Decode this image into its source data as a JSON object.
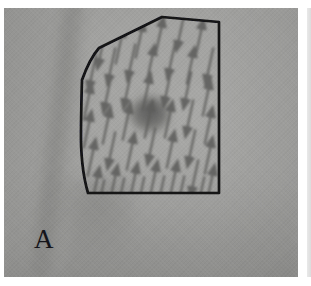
{
  "figure": {
    "panel_label": "A",
    "modality": "clinical photograph",
    "colors": {
      "skin_light": "#a8a8a6",
      "skin_mid": "#9a9a98",
      "skin_shadow": "#8b8b89",
      "outline_ink": "#121216",
      "arrow_ink": "#5d5d5b",
      "lesion": "#6f6f6d",
      "plate_background": "#ffffff",
      "panel_letter_color": "#15151a"
    },
    "plate": {
      "x": 4,
      "y": 8,
      "width": 294,
      "height": 269
    },
    "outline": {
      "name": "marked-region-polygon",
      "stroke_width": 2.6,
      "closed": true,
      "vertices": [
        [
          158,
          9
        ],
        [
          215,
          14
        ],
        [
          215,
          185
        ],
        [
          84,
          185
        ],
        [
          77,
          120
        ],
        [
          78,
          72
        ],
        [
          95,
          40
        ]
      ]
    },
    "lesion": {
      "name": "central-lesion",
      "cx": 146,
      "cy": 106,
      "rx": 19,
      "ry": 17
    },
    "arrows": {
      "count": 60,
      "tilt_degrees": 12,
      "directions": [
        "up",
        "down"
      ],
      "stroke_width": 2.2,
      "head_width": 11,
      "head_length": 13
    }
  },
  "chart_data": {
    "type": "scatter",
    "xlabel": "",
    "ylabel": "",
    "legend": [],
    "annotations": [
      "A"
    ],
    "series": [
      {
        "name": "arrow-field",
        "note": "each point is an arrow base with its pointing direction",
        "points": [
          {
            "x": 97,
            "y": 44,
            "dir": "down"
          },
          {
            "x": 116,
            "y": 36,
            "dir": "up"
          },
          {
            "x": 136,
            "y": 30,
            "dir": "up"
          },
          {
            "x": 156,
            "y": 26,
            "dir": "up"
          },
          {
            "x": 176,
            "y": 26,
            "dir": "down"
          },
          {
            "x": 196,
            "y": 28,
            "dir": "up"
          },
          {
            "x": 88,
            "y": 66,
            "dir": "down"
          },
          {
            "x": 107,
            "y": 60,
            "dir": "down"
          },
          {
            "x": 127,
            "y": 56,
            "dir": "down"
          },
          {
            "x": 147,
            "y": 54,
            "dir": "up"
          },
          {
            "x": 167,
            "y": 54,
            "dir": "down"
          },
          {
            "x": 187,
            "y": 56,
            "dir": "up"
          },
          {
            "x": 205,
            "y": 60,
            "dir": "down"
          },
          {
            "x": 84,
            "y": 92,
            "dir": "up"
          },
          {
            "x": 103,
            "y": 88,
            "dir": "down"
          },
          {
            "x": 123,
            "y": 84,
            "dir": "down"
          },
          {
            "x": 143,
            "y": 82,
            "dir": "up"
          },
          {
            "x": 163,
            "y": 82,
            "dir": "down"
          },
          {
            "x": 183,
            "y": 84,
            "dir": "down"
          },
          {
            "x": 203,
            "y": 88,
            "dir": "up"
          },
          {
            "x": 84,
            "y": 120,
            "dir": "up"
          },
          {
            "x": 103,
            "y": 116,
            "dir": "up"
          },
          {
            "x": 123,
            "y": 112,
            "dir": "up"
          },
          {
            "x": 145,
            "y": 110,
            "dir": "up"
          },
          {
            "x": 165,
            "y": 110,
            "dir": "up"
          },
          {
            "x": 185,
            "y": 112,
            "dir": "down"
          },
          {
            "x": 205,
            "y": 116,
            "dir": "up"
          },
          {
            "x": 88,
            "y": 148,
            "dir": "up"
          },
          {
            "x": 107,
            "y": 144,
            "dir": "down"
          },
          {
            "x": 127,
            "y": 142,
            "dir": "up"
          },
          {
            "x": 147,
            "y": 140,
            "dir": "down"
          },
          {
            "x": 167,
            "y": 140,
            "dir": "up"
          },
          {
            "x": 187,
            "y": 142,
            "dir": "down"
          },
          {
            "x": 205,
            "y": 146,
            "dir": "up"
          },
          {
            "x": 92,
            "y": 176,
            "dir": "up"
          },
          {
            "x": 110,
            "y": 174,
            "dir": "up"
          },
          {
            "x": 130,
            "y": 172,
            "dir": "up"
          },
          {
            "x": 150,
            "y": 170,
            "dir": "up"
          },
          {
            "x": 170,
            "y": 170,
            "dir": "up"
          },
          {
            "x": 190,
            "y": 172,
            "dir": "down"
          },
          {
            "x": 207,
            "y": 174,
            "dir": "up"
          },
          {
            "x": 96,
            "y": 192,
            "dir": "down"
          },
          {
            "x": 116,
            "y": 190,
            "dir": "down"
          },
          {
            "x": 136,
            "y": 189,
            "dir": "down"
          },
          {
            "x": 156,
            "y": 188,
            "dir": "down"
          },
          {
            "x": 176,
            "y": 188,
            "dir": "down"
          },
          {
            "x": 196,
            "y": 189,
            "dir": "down"
          }
        ]
      }
    ]
  }
}
